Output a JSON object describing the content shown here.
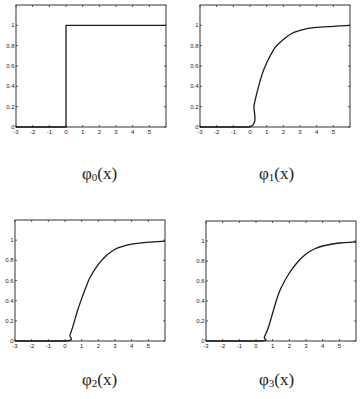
{
  "chart_data": [
    {
      "type": "line",
      "title": "",
      "caption": {
        "base": "φ",
        "sub": "0",
        "arg": "(x)"
      },
      "xlabel": "",
      "ylabel": "",
      "xlim": [
        -3,
        6
      ],
      "ylim": [
        0,
        1.2
      ],
      "xticks": [
        -3,
        -2,
        -1,
        0,
        1,
        2,
        3,
        4,
        5
      ],
      "yticks": [
        0,
        0.2,
        0.4,
        0.6,
        0.8,
        1
      ],
      "ytick_labels": [
        "0",
        "0.2",
        "0.4",
        "0.6",
        "0.8",
        "1"
      ],
      "grid": false,
      "series": [
        {
          "name": "phi0",
          "x": [
            -3,
            0,
            0,
            6
          ],
          "y": [
            0,
            0,
            1,
            1
          ]
        }
      ]
    },
    {
      "type": "line",
      "title": "",
      "caption": {
        "base": "φ",
        "sub": "1",
        "arg": "(x)"
      },
      "xlabel": "",
      "ylabel": "",
      "xlim": [
        -3,
        6
      ],
      "ylim": [
        0,
        1.2
      ],
      "xticks": [
        -3,
        -2,
        -1,
        0,
        1,
        2,
        3,
        4,
        5
      ],
      "yticks": [
        0,
        0.2,
        0.4,
        0.6,
        0.8,
        1
      ],
      "ytick_labels": [
        "0",
        "0.2",
        "0.4",
        "0.6",
        "0.8",
        "1"
      ],
      "grid": false,
      "series": [
        {
          "name": "phi1",
          "x": [
            -3,
            0,
            0.25,
            0.5,
            0.75,
            1,
            1.5,
            2,
            2.5,
            3,
            3.5,
            4,
            5,
            6
          ],
          "y": [
            0,
            0,
            0.22,
            0.39,
            0.53,
            0.63,
            0.78,
            0.86,
            0.92,
            0.95,
            0.97,
            0.98,
            0.99,
            1.0
          ]
        }
      ]
    },
    {
      "type": "line",
      "title": "",
      "caption": {
        "base": "φ",
        "sub": "2",
        "arg": "(x)"
      },
      "xlabel": "",
      "ylabel": "",
      "xlim": [
        -3,
        6
      ],
      "ylim": [
        0,
        1.2
      ],
      "xticks": [
        -3,
        -2,
        -1,
        0,
        1,
        2,
        3,
        4,
        5
      ],
      "yticks": [
        0,
        0.2,
        0.4,
        0.6,
        0.8,
        1
      ],
      "ytick_labels": [
        "0",
        "0.2",
        "0.4",
        "0.6",
        "0.8",
        "1"
      ],
      "grid": false,
      "series": [
        {
          "name": "phi2",
          "x": [
            -3,
            0.1,
            0.3,
            0.5,
            0.75,
            1,
            1.25,
            1.5,
            2,
            2.5,
            3,
            3.5,
            4,
            5,
            6
          ],
          "y": [
            0,
            0,
            0.06,
            0.16,
            0.3,
            0.42,
            0.53,
            0.63,
            0.76,
            0.85,
            0.91,
            0.94,
            0.96,
            0.98,
            0.99
          ]
        }
      ]
    },
    {
      "type": "line",
      "title": "",
      "caption": {
        "base": "φ",
        "sub": "3",
        "arg": "(x)"
      },
      "xlabel": "",
      "ylabel": "",
      "xlim": [
        -3,
        6
      ],
      "ylim": [
        0,
        1.2
      ],
      "xticks": [
        -3,
        -2,
        -1,
        0,
        1,
        2,
        3,
        4,
        5
      ],
      "yticks": [
        0,
        0.2,
        0.4,
        0.6,
        0.8,
        1
      ],
      "ytick_labels": [
        "0",
        "0.2",
        "0.4",
        "0.6",
        "0.8",
        "1"
      ],
      "grid": false,
      "series": [
        {
          "name": "phi3",
          "x": [
            -3,
            0.3,
            0.5,
            0.75,
            1,
            1.25,
            1.5,
            2,
            2.5,
            3,
            3.5,
            4,
            5,
            6
          ],
          "y": [
            0,
            0,
            0.04,
            0.14,
            0.28,
            0.42,
            0.53,
            0.68,
            0.79,
            0.87,
            0.92,
            0.95,
            0.98,
            0.99
          ]
        }
      ]
    }
  ]
}
